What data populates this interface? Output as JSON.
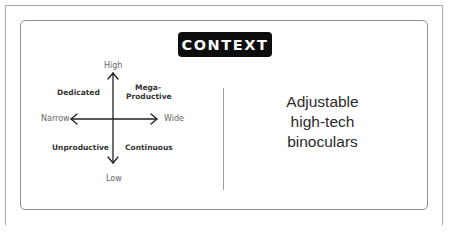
{
  "badge": {
    "label": "CONTEXT"
  },
  "matrix": {
    "axes": {
      "top": "High",
      "bottom": "Low",
      "left": "Narrow",
      "right": "Wide"
    },
    "quadrants": {
      "top_left": "Dedicated",
      "top_right_line1": "Mega-",
      "top_right_line2": "Productive",
      "bottom_left": "Unproductive",
      "bottom_right": "Continuous"
    }
  },
  "product": {
    "line1": "Adjustable",
    "line2": "high-tech",
    "line3": "binoculars"
  },
  "colors": {
    "badge_bg": "#0d0d0d",
    "badge_text": "#ffffff",
    "border": "#8f8f8f",
    "axis_line": "#222222"
  }
}
